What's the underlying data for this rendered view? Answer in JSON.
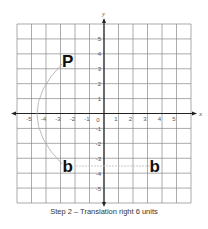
{
  "diagram": {
    "axes": {
      "x_label": "x",
      "y_label": "y",
      "x_range": [
        -6,
        6
      ],
      "y_range": [
        -6,
        6
      ]
    },
    "x_ticks": [
      "-5",
      "-4",
      "-3",
      "-2",
      "-1",
      "1",
      "2",
      "3",
      "4",
      "5"
    ],
    "y_ticks": [
      "5",
      "4",
      "3",
      "2",
      "1",
      "-1",
      "-2",
      "-3",
      "-4",
      "-5"
    ],
    "origin_label": "0",
    "shapes": [
      {
        "letter": "P",
        "x": -2.5,
        "y": 3.5,
        "role": "original"
      },
      {
        "letter": "b",
        "x": -2.5,
        "y": -3.5,
        "role": "after-reflection"
      },
      {
        "letter": "b",
        "x": 3.5,
        "y": -3.5,
        "role": "after-translation"
      }
    ],
    "caption": "Step 2 – Translation right 6 units",
    "colors": {
      "grid": "#888888",
      "axis": "#222222",
      "arc": "#aaaaaa",
      "letter": "#111111"
    }
  }
}
